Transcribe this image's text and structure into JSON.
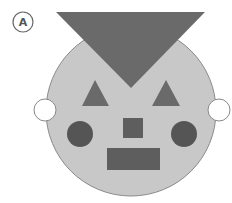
{
  "figure": {
    "label": "A",
    "colors": {
      "background": "#ffffff",
      "face": "#c8c8c8",
      "face_stroke": "#8a8a8a",
      "dark_shape": "#6a6a6a",
      "darker_shape": "#555555",
      "ear_fill": "#ffffff",
      "ear_stroke": "#888888",
      "label_stroke": "#666666"
    },
    "shapes": [
      {
        "name": "face-circle",
        "type": "circle"
      },
      {
        "name": "hat-triangle",
        "type": "inverted-triangle"
      },
      {
        "name": "left-ear",
        "type": "circle"
      },
      {
        "name": "right-ear",
        "type": "circle"
      },
      {
        "name": "left-triangle",
        "type": "triangle"
      },
      {
        "name": "right-triangle",
        "type": "triangle"
      },
      {
        "name": "left-eye",
        "type": "circle"
      },
      {
        "name": "right-eye",
        "type": "circle"
      },
      {
        "name": "nose-square",
        "type": "square"
      },
      {
        "name": "mouth-rectangle",
        "type": "rectangle"
      }
    ]
  }
}
